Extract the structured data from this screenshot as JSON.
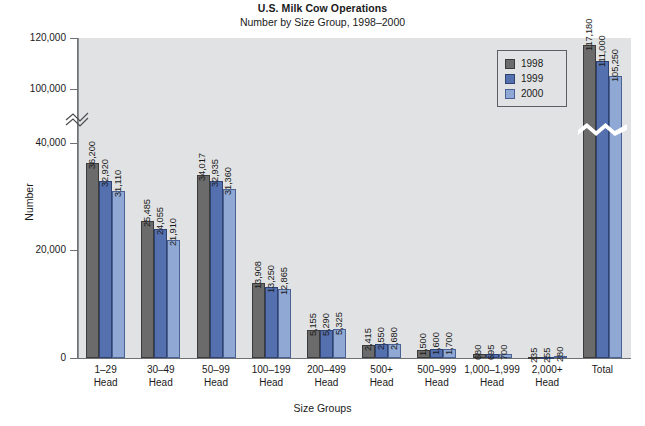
{
  "chart_data": {
    "type": "bar",
    "title": "U.S. Milk Cow Operations",
    "subtitle": "Number by Size Group, 1998–2000",
    "xlabel": "Size Groups",
    "ylabel": "Number",
    "categories": [
      "1–29 Head",
      "30–49 Head",
      "50–99 Head",
      "100–199 Head",
      "200–499 Head",
      "500+ Head",
      "500–999 Head",
      "1,000–1,999 Head",
      "2,000+ Head",
      "Total"
    ],
    "series": [
      {
        "name": "1998",
        "color": "#6b6b6b",
        "values": [
          36200,
          25485,
          34017,
          13908,
          5155,
          2415,
          1500,
          680,
          235,
          117180
        ]
      },
      {
        "name": "1999",
        "color": "#5570ae",
        "values": [
          32920,
          24055,
          32935,
          13250,
          5290,
          2550,
          1600,
          695,
          255,
          111000
        ]
      },
      {
        "name": "2000",
        "color": "#8fa8d4",
        "values": [
          31110,
          21910,
          31360,
          12865,
          5325,
          2680,
          1700,
          700,
          280,
          105250
        ]
      }
    ],
    "ytick_labels": [
      "0",
      "20,000",
      "40,000",
      "100,000",
      "120,000"
    ],
    "ytick_values": [
      0,
      20000,
      40000,
      100000,
      120000
    ],
    "axis_break": true,
    "grid": false,
    "legend_position": "top-right",
    "legend_entries": [
      "1998",
      "1999",
      "2000"
    ]
  },
  "categories_display": [
    {
      "line1": "1–29",
      "line2": "Head"
    },
    {
      "line1": "30–49",
      "line2": "Head"
    },
    {
      "line1": "50–99",
      "line2": "Head"
    },
    {
      "line1": "100–199",
      "line2": "Head"
    },
    {
      "line1": "200–499",
      "line2": "Head"
    },
    {
      "line1": "500+",
      "line2": "Head"
    },
    {
      "line1": "500–999",
      "line2": "Head"
    },
    {
      "line1": "1,000–1,999",
      "line2": "Head"
    },
    {
      "line1": "2,000+",
      "line2": "Head"
    },
    {
      "line1": "Total",
      "line2": ""
    }
  ],
  "value_labels": [
    [
      "36,200",
      "32,920",
      "31,110"
    ],
    [
      "25,485",
      "24,055",
      "21,910"
    ],
    [
      "34,017",
      "32,935",
      "31,360"
    ],
    [
      "13,908",
      "13,250",
      "12,865"
    ],
    [
      "5,155",
      "5,290",
      "5,325"
    ],
    [
      "2,415",
      "2,550",
      "2,680"
    ],
    [
      "1,500",
      "1,600",
      "1,700"
    ],
    [
      "680",
      "695",
      "700"
    ],
    [
      "235",
      "255",
      "280"
    ],
    [
      "117,180",
      "111,000",
      "105,250"
    ]
  ]
}
